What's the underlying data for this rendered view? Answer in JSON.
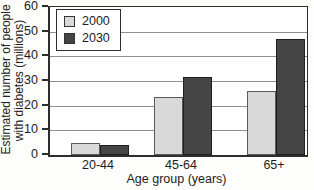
{
  "chart": {
    "y_title_line1": "Estimated number of people",
    "y_title_line2": "with diabetes (millions)",
    "x_title": "Age group (years)"
  },
  "chart_data": {
    "type": "bar",
    "title": "",
    "xlabel": "Age group (years)",
    "ylabel": "Estimated number of people with diabetes (millions)",
    "categories": [
      "20-44",
      "45-64",
      "65+"
    ],
    "series": [
      {
        "name": "2000",
        "values": [
          5,
          23.5,
          26
        ],
        "color": "#d9d9d9",
        "border_color": "#5a5a5a"
      },
      {
        "name": "2030",
        "values": [
          4,
          31.5,
          47
        ],
        "color": "#454545",
        "border_color": "#1f1f1f"
      }
    ],
    "ylim": [
      0,
      60
    ],
    "ytick_interval": 10,
    "yticks": [
      0,
      10,
      20,
      30,
      40,
      50,
      60
    ],
    "grid": true,
    "gridline_color": "#8f8f8f",
    "axis_color": "#2e2e2e",
    "legend_position": "upper-left-inside"
  }
}
